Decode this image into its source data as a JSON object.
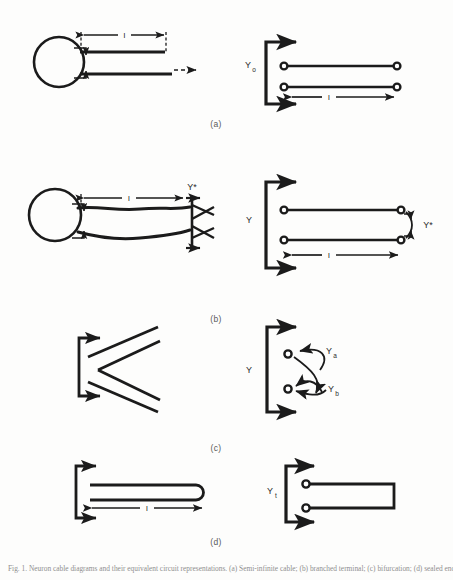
{
  "figure": {
    "panel_labels": [
      "(a)",
      "(b)",
      "(c)",
      "(d)"
    ],
    "caption": "Fig. 1. Neuron cable diagrams and their equivalent circuit representations. (a) Semi-infinite cable; (b) branched terminal; (c) bifurcation; (d) sealed end."
  },
  "panels": {
    "a": {
      "label": "(a)",
      "length_label": "l",
      "admittance_label": "Y",
      "admittance_sub": "o",
      "drawing": "soma-with-semi-infinite-cable",
      "circuit": "two-port-open-extension"
    },
    "b": {
      "label": "(b)",
      "length_label": "l",
      "admittance_label": "Y",
      "admittance_sub": "",
      "terminal_label": "Y*",
      "drawing": "soma-with-tapered-cable-branched-terminal",
      "circuit": "two-port-terminated-in-Y-star"
    },
    "c": {
      "label": "(c)",
      "admittance_label": "Y",
      "branch_a_label": "Y",
      "branch_a_sub": "a",
      "branch_b_label": "Y",
      "branch_b_sub": "b",
      "drawing": "bifurcating-cable",
      "circuit": "two-port-with-two-branch-admittances"
    },
    "d": {
      "label": "(d)",
      "length_label": "l",
      "admittance_label": "Y",
      "admittance_sub": "t",
      "drawing": "cable-with-sealed-rounded-end",
      "circuit": "two-port-short-circuit-termination"
    }
  },
  "colors": {
    "ink": "#1b1b1b",
    "paper": "#fdfdfc",
    "label_gray": "#5a5a5a",
    "caption_gray": "#8f8f8f"
  }
}
